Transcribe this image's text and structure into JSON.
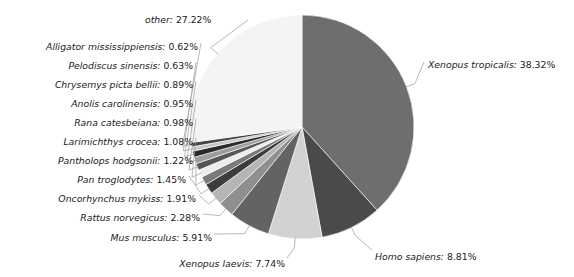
{
  "chart_data": {
    "type": "pie",
    "title": "",
    "start_angle_deg": 0,
    "direction": "clockwise",
    "legend": "none",
    "labels_outside": true,
    "categories": [
      "Xenopus tropicalis",
      "Homo sapiens",
      "Xenopus laevis",
      "Mus musculus",
      "Rattus norvegicus",
      "Oncorhynchus mykiss",
      "Pan troglodytes",
      "Pantholops hodgsonii",
      "Larimichthys crocea",
      "Rana catesbeiana",
      "Anolis carolinensis",
      "Chrysemys picta bellii",
      "Pelodiscus sinensis",
      "Alligator mississippiensis",
      "other"
    ],
    "values": [
      38.32,
      8.81,
      7.74,
      5.91,
      2.28,
      1.91,
      1.45,
      1.22,
      1.08,
      0.98,
      0.95,
      0.89,
      0.63,
      0.62,
      27.22
    ],
    "unit": "%",
    "colors": [
      "#6e6e6e",
      "#4a4a4a",
      "#d2d2d2",
      "#636363",
      "#8f8f8f",
      "#b5b5b5",
      "#3c3c3c",
      "#7a7a7a",
      "#ededed",
      "#565656",
      "#9e9e9e",
      "#2b2b2b",
      "#c8c8c8",
      "#454545",
      "#f4f4f4"
    ]
  },
  "slices": [
    {
      "name": "Xenopus tropicalis",
      "value": "38.32%",
      "label": "Xenopus tropicalis:",
      "color": "#6e6e6e"
    },
    {
      "name": "Homo sapiens",
      "value": "8.81%",
      "label": "Homo sapiens:",
      "color": "#4a4a4a"
    },
    {
      "name": "Xenopus laevis",
      "value": "7.74%",
      "label": "Xenopus laevis:",
      "color": "#d2d2d2"
    },
    {
      "name": "Mus musculus",
      "value": "5.91%",
      "label": "Mus musculus:",
      "color": "#636363"
    },
    {
      "name": "Rattus norvegicus",
      "value": "2.28%",
      "label": "Rattus norvegicus:",
      "color": "#8f8f8f"
    },
    {
      "name": "Oncorhynchus mykiss",
      "value": "1.91%",
      "label": "Oncorhynchus mykiss:",
      "color": "#b5b5b5"
    },
    {
      "name": "Pan troglodytes",
      "value": "1.45%",
      "label": "Pan troglodytes:",
      "color": "#3c3c3c"
    },
    {
      "name": "Pantholops hodgsonii",
      "value": "1.22%",
      "label": "Pantholops hodgsonii:",
      "color": "#7a7a7a"
    },
    {
      "name": "Larimichthys crocea",
      "value": "1.08%",
      "label": "Larimichthys crocea:",
      "color": "#ededed"
    },
    {
      "name": "Rana catesbeiana",
      "value": "0.98%",
      "label": "Rana catesbeiana:",
      "color": "#565656"
    },
    {
      "name": "Anolis carolinensis",
      "value": "0.95%",
      "label": "Anolis carolinensis:",
      "color": "#9e9e9e"
    },
    {
      "name": "Chrysemys picta bellii",
      "value": "0.89%",
      "label": "Chrysemys picta bellii:",
      "color": "#2b2b2b"
    },
    {
      "name": "Pelodiscus sinensis",
      "value": "0.63%",
      "label": "Pelodiscus sinensis:",
      "color": "#c8c8c8"
    },
    {
      "name": "Alligator mississippiensis",
      "value": "0.62%",
      "label": "Alligator mississippiensis:",
      "color": "#454545"
    },
    {
      "name": "other",
      "value": "27.22%",
      "label": "other:",
      "color": "#f4f4f4"
    }
  ]
}
